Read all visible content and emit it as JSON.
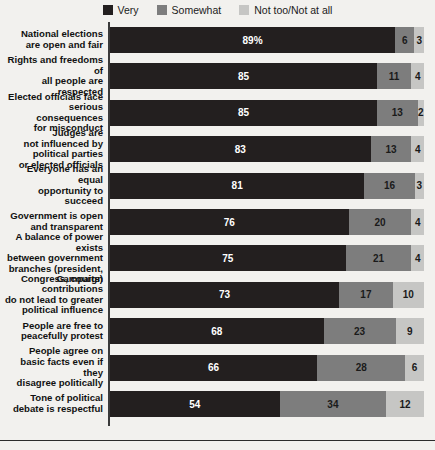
{
  "chart_data": {
    "type": "bar",
    "subtype": "stacked-horizontal-100",
    "title": "",
    "subtitle": "",
    "xlabel": "",
    "ylabel": "",
    "xlim": [
      0,
      100
    ],
    "grid": false,
    "legend_position": "top-center",
    "categories": [
      "National elections are open and fair",
      "Rights and freedoms of all people are respected",
      "Elected officials face serious consequences for misconduct",
      "Judges are not influenced by political parties or elected officials",
      "Everyone has an equal opportunity to succeed",
      "Government is open and transparent",
      "A balance of power exists between government branches (president, Congress, courts)",
      "Campaign contributions do not lead to greater political influence",
      "People are free to peacefully protest",
      "People agree on basic facts even if they disagree politically",
      "Tone of political debate is respectful"
    ],
    "category_lines": [
      [
        "National elections",
        "are open and fair"
      ],
      [
        "Rights and freedoms of",
        "all people are respected"
      ],
      [
        "Elected officials face",
        "serious consequences",
        "for misconduct"
      ],
      [
        "Judges are",
        "not influenced by",
        "political parties",
        "or elected officials"
      ],
      [
        "Everyone has an equal",
        "opportunity to succeed"
      ],
      [
        "Government is open",
        "and transparent"
      ],
      [
        "A balance of power exists",
        "between government",
        "branches (president,",
        "Congress, courts)"
      ],
      [
        "Campaign contributions",
        "do not lead to greater",
        "political influence"
      ],
      [
        "People are free to",
        "peacefully protest"
      ],
      [
        "People agree on",
        "basic facts even if they",
        "disagree politically"
      ],
      [
        "Tone of political",
        "debate is respectful"
      ]
    ],
    "series": [
      {
        "name": "Very",
        "color": "#231f1f",
        "values": [
          89,
          85,
          85,
          83,
          81,
          76,
          75,
          73,
          68,
          66,
          54
        ]
      },
      {
        "name": "Somewhat",
        "color": "#7d7d7d",
        "values": [
          6,
          11,
          13,
          13,
          16,
          20,
          21,
          17,
          23,
          28,
          34
        ]
      },
      {
        "name": "Not too/Not at all",
        "color": "#c6c6c4",
        "values": [
          3,
          4,
          2,
          4,
          3,
          4,
          4,
          10,
          9,
          6,
          12
        ]
      }
    ],
    "data_labels": [
      [
        "89%",
        "6",
        "3"
      ],
      [
        "85",
        "11",
        "4"
      ],
      [
        "85",
        "13",
        "2"
      ],
      [
        "83",
        "13",
        "4"
      ],
      [
        "81",
        "16",
        "3"
      ],
      [
        "76",
        "20",
        "4"
      ],
      [
        "75",
        "21",
        "4"
      ],
      [
        "73",
        "17",
        "10"
      ],
      [
        "68",
        "23",
        "9"
      ],
      [
        "66",
        "28",
        "6"
      ],
      [
        "54",
        "34",
        "12"
      ]
    ]
  },
  "legend": {
    "items": [
      {
        "label": "Very",
        "color": "#231f1f"
      },
      {
        "label": "Somewhat",
        "color": "#7d7d7d"
      },
      {
        "label": "Not too/Not at all",
        "color": "#c6c6c4"
      }
    ]
  }
}
